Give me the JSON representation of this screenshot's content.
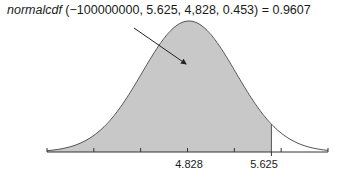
{
  "chart_data": {
    "type": "area",
    "title_func": "normalcdf",
    "title_args": " (−100000000, 5.625, 4,828, 0.453) = 0.9607",
    "mean": 4.828,
    "sd": 0.453,
    "lower": -100000000,
    "upper": 5.625,
    "probability": 0.9607,
    "tick_labels": [
      {
        "value": 4.828,
        "label": "4.828"
      },
      {
        "value": 5.625,
        "label": "5.625"
      }
    ],
    "xlim": [
      3.47,
      6.19
    ],
    "shaded_region": "left of 5.625",
    "colors": {
      "shade": "#c8c8c8",
      "curve": "#555555",
      "axis": "#333333"
    }
  }
}
